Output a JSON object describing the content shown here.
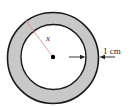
{
  "diagram": {
    "title": "",
    "radius_label": "x",
    "thickness_label": "1 cm",
    "colors": {
      "ring_fill": "#c8c8c8",
      "stroke": "#1a1a1a",
      "radius_line": "#d9908a",
      "center_dot": "#000000",
      "background": "#ffffff"
    }
  }
}
